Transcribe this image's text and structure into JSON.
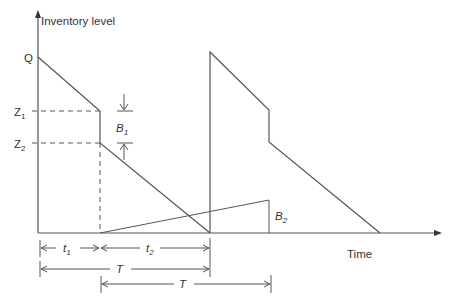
{
  "diagram": {
    "type": "inventory-level-vs-time",
    "y_axis_label": "Inventory level",
    "x_axis_label": "Time",
    "levels": {
      "Q": "Q",
      "Z1": {
        "base": "Z",
        "sub": "1"
      },
      "Z2": {
        "base": "Z",
        "sub": "2"
      }
    },
    "annotations": {
      "B1": {
        "base": "B",
        "sub": "1"
      },
      "B2": {
        "base": "B",
        "sub": "2"
      },
      "t1": {
        "base": "t",
        "sub": "1"
      },
      "t2": {
        "base": "t",
        "sub": "2"
      },
      "T_first": "T",
      "T_second": "T"
    },
    "colors": {
      "line": "#555555",
      "text": "#333333",
      "background": "#ffffff"
    }
  }
}
